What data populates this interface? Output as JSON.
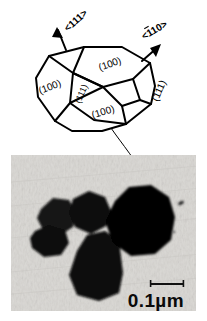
{
  "figure": {
    "type": "crystal-habit-schematic-with-tem-micrograph",
    "background_color": "#ffffff",
    "ink_color": "#000000"
  },
  "diagram": {
    "name": "crystal-habit-polyhedron",
    "facet_labels": [
      {
        "id": "facet-100-left",
        "text": "(100)",
        "x": 51,
        "y": 88,
        "rotate": -22
      },
      {
        "id": "facet-100-top",
        "text": "(100)",
        "x": 110,
        "y": 66,
        "rotate": -20
      },
      {
        "id": "facet-111-center",
        "text": "(111)",
        "x": 83,
        "y": 93,
        "rotate": -68
      },
      {
        "id": "facet-100-bottom",
        "text": "(100)",
        "x": 105,
        "y": 112,
        "rotate": -17
      },
      {
        "id": "facet-111-right",
        "text": "(111)",
        "x": 160,
        "y": 90,
        "rotate": -66
      }
    ],
    "direction_arrows": [
      {
        "id": "direction-111",
        "text": "<111>",
        "overline": false,
        "label_x": 76,
        "label_y": 22,
        "rotate": -42,
        "arrow_tail_x": 66,
        "arrow_tail_y": 48,
        "arrow_head_x": 57,
        "arrow_head_y": 28
      },
      {
        "id": "direction-1bar10",
        "text": "<110>",
        "overline_char": "1",
        "overline": true,
        "display": "<1̄10>",
        "label_x": 155,
        "label_y": 32,
        "rotate": -32,
        "arrow_tail_x": 141,
        "arrow_tail_y": 60,
        "arrow_head_x": 160,
        "arrow_head_y": 44
      }
    ],
    "leader_line": {
      "id": "leader-line-to-particle",
      "from_x": 110,
      "from_y": 130,
      "to_x": 148,
      "to_y": 186
    }
  },
  "micrograph": {
    "name": "tem-micrograph",
    "description": "Transmission electron micrograph showing five dark faceted particles on a light grey substrate",
    "frame": {
      "x": 11,
      "y": 155,
      "width": 185,
      "height": 156
    },
    "background_color": "#d8d6d2",
    "particle_color": "#0d0d0d",
    "particle_count": 5,
    "particles": [
      {
        "id": "particle-upper-left",
        "cx": 44,
        "cy": 62,
        "rx": 22,
        "ry": 20
      },
      {
        "id": "particle-lower-left",
        "cx": 38,
        "cy": 86,
        "rx": 19,
        "ry": 17
      },
      {
        "id": "particle-center",
        "cx": 78,
        "cy": 58,
        "rx": 22,
        "ry": 21
      },
      {
        "id": "particle-center-lower",
        "cx": 84,
        "cy": 110,
        "rx": 28,
        "ry": 34
      },
      {
        "id": "particle-large-right",
        "cx": 127,
        "cy": 66,
        "rx": 36,
        "ry": 35
      }
    ],
    "specks": [
      {
        "id": "speck-right",
        "cx": 170,
        "cy": 48,
        "rx": 3.0,
        "ry": 1.7
      },
      {
        "id": "speck-lower-right",
        "cx": 163,
        "cy": 76,
        "rx": 1.1,
        "ry": 1.1
      }
    ],
    "scale_bar": {
      "id": "scale-bar",
      "label": "0.1µm",
      "value": 0.1,
      "unit": "µm",
      "bar_x1": 139,
      "bar_x2": 173,
      "bar_y": 129,
      "label_x": 117,
      "label_y": 150
    }
  }
}
